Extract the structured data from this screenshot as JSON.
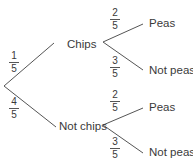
{
  "tree": {
    "root": {
      "branches": [
        {
          "label": "Chips",
          "prob": {
            "num": "1",
            "den": "5"
          },
          "children": [
            {
              "label": "Peas",
              "prob": {
                "num": "2",
                "den": "5"
              }
            },
            {
              "label": "Not peas",
              "prob": {
                "num": "3",
                "den": "5"
              }
            }
          ]
        },
        {
          "label": "Not chips",
          "prob": {
            "num": "4",
            "den": "5"
          },
          "children": [
            {
              "label": "Peas",
              "prob": {
                "num": "2",
                "den": "5"
              }
            },
            {
              "label": "Not peas",
              "prob": {
                "num": "3",
                "den": "5"
              }
            }
          ]
        }
      ]
    }
  },
  "colors": {
    "line": "#555555",
    "text": "#3a3a3a"
  }
}
